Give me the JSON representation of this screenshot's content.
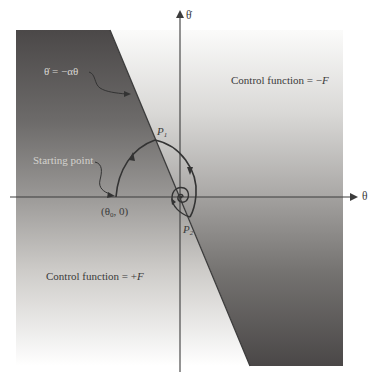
{
  "figure": {
    "type": "phase-plane diagram",
    "axes": {
      "x_label": "θ",
      "y_label": "θ̇"
    },
    "switching_line": {
      "label_lhs": "θ̇",
      "label_eq": "=",
      "label_rhs": "−αθ",
      "label_full": "θ̇ = −αθ"
    },
    "regions": {
      "upper_right": {
        "label_prefix": "Control function = ",
        "label_sign": "−",
        "label_var": "F"
      },
      "lower_left": {
        "label_prefix": "Control function = ",
        "label_sign": "+",
        "label_var": "F"
      }
    },
    "points": {
      "starting_point_label": "Starting point",
      "start_coord_open": "(θ",
      "start_coord_sub": "0",
      "start_coord_close": ", 0)",
      "p1_letter": "P",
      "p1_sub": "1",
      "p2_letter": "P",
      "p2_sub": "2"
    },
    "colors": {
      "dark_region": "#4a4747",
      "mid_region": "#8f8d8b",
      "light_region": "#f4f3f1",
      "line": "#3c3c3c",
      "text": "#3a3a3a"
    }
  }
}
